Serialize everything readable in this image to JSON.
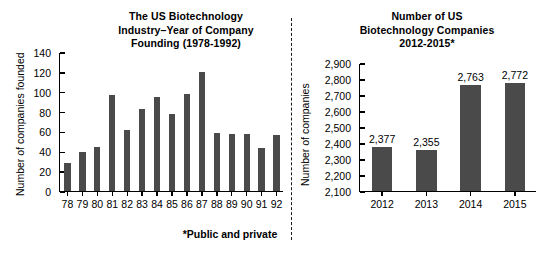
{
  "footnote": "*Public and private",
  "divider": {
    "style": "dashed-vertical"
  },
  "colors": {
    "bar": "#4a4a4a",
    "axis": "#000000",
    "background": "#ffffff",
    "text": "#111111"
  },
  "chart_data": [
    {
      "id": "founding-year",
      "type": "bar",
      "title": "The US Biotechnology Industry–Year of Company Founding (1978-1992)",
      "title_lines": [
        "The US Biotechnology",
        "Industry–Year of Company",
        "Founding (1978-1992)"
      ],
      "xlabel": "",
      "ylabel": "Number of companies founded",
      "categories": [
        "78",
        "79",
        "80",
        "81",
        "82",
        "83",
        "84",
        "85",
        "86",
        "87",
        "88",
        "89",
        "90",
        "91",
        "92"
      ],
      "values": [
        28,
        39,
        44,
        97,
        61,
        83,
        95,
        78,
        98,
        120,
        58,
        57,
        57,
        43,
        56
      ],
      "value_labels_shown": false,
      "ylim": [
        0,
        140
      ],
      "yticks": [
        0,
        20,
        40,
        60,
        80,
        100,
        120,
        140
      ],
      "ytick_labels": [
        "0",
        "20",
        "40",
        "60",
        "80",
        "100",
        "120",
        "140"
      ],
      "grid": false,
      "legend": false
    },
    {
      "id": "company-count",
      "type": "bar",
      "title": "Number of US Biotechnology Companies 2012-2015*",
      "title_lines": [
        "Number of US",
        "Biotechnology Companies",
        "2012-2015*"
      ],
      "xlabel": "",
      "ylabel": "Number of companies",
      "categories": [
        "2012",
        "2013",
        "2014",
        "2015"
      ],
      "values": [
        2377,
        2355,
        2763,
        2772
      ],
      "value_labels": [
        "2,377",
        "2,355",
        "2,763",
        "2,772"
      ],
      "value_labels_shown": true,
      "ylim": [
        2100,
        2900
      ],
      "yticks": [
        2100,
        2200,
        2300,
        2400,
        2500,
        2600,
        2700,
        2800,
        2900
      ],
      "ytick_labels": [
        "2,100",
        "2,200",
        "2,300",
        "2,400",
        "2,500",
        "2,600",
        "2,700",
        "2,800",
        "2,900"
      ],
      "grid": false,
      "legend": false
    }
  ]
}
